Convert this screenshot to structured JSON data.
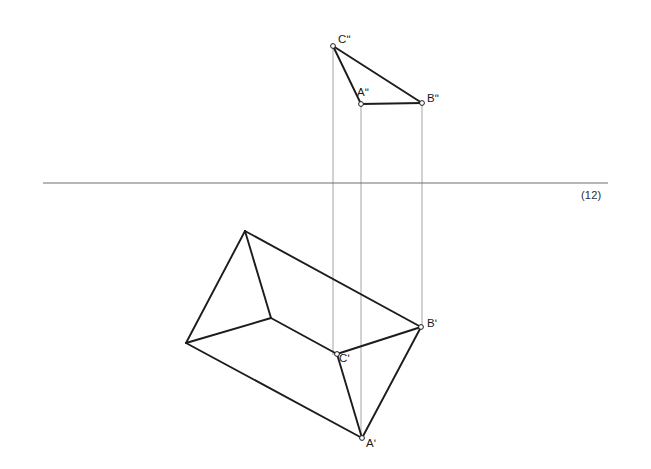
{
  "figure": {
    "type": "descriptive-geometry-orthographic-projection",
    "background_color": "#ffffff",
    "stroke_color": "#1c1c1c",
    "thin_stroke_color": "#9a9a9a",
    "ground_line_color": "#6e6e6e",
    "ground_line_label": "(12)",
    "vertex_marker_fill": "#ffffff"
  },
  "labels": {
    "c_front": "Cʺ",
    "a_front": "Aʺ",
    "b_front": "Bʺ",
    "c_top": "Cʹ",
    "b_top": "Bʹ",
    "a_top": "Aʹ",
    "ground_line": "(12)"
  },
  "geometry": {
    "ground_line": {
      "x1": 43,
      "y1": 183,
      "x2": 608,
      "y2": 183
    },
    "front_triangle": {
      "vertices": [
        {
          "name": "Cʺ",
          "x": 333,
          "y": 46
        },
        {
          "name": "Aʺ",
          "x": 361,
          "y": 104
        },
        {
          "name": "Bʺ",
          "x": 422,
          "y": 103
        }
      ]
    },
    "projection_lines": [
      {
        "x": 333,
        "y1": 46,
        "y2": 355
      },
      {
        "x": 361,
        "y1": 104,
        "y2": 440
      },
      {
        "x": 422,
        "y1": 103,
        "y2": 328
      }
    ],
    "top_polygon": {
      "vertices": [
        {
          "name": "apex",
          "x": 245,
          "y": 231
        },
        {
          "name": "left",
          "x": 186,
          "y": 343
        },
        {
          "name": "center",
          "x": 271,
          "y": 318
        },
        {
          "name": "Cʹ",
          "x": 337,
          "y": 354
        },
        {
          "name": "Bʹ",
          "x": 421,
          "y": 327
        },
        {
          "name": "Aʹ",
          "x": 362,
          "y": 438
        }
      ],
      "edges": [
        [
          "apex",
          "left"
        ],
        [
          "apex",
          "center"
        ],
        [
          "apex",
          "Bʹ"
        ],
        [
          "left",
          "center"
        ],
        [
          "left",
          "Aʹ"
        ],
        [
          "center",
          "Cʹ"
        ],
        [
          "Cʹ",
          "Bʹ"
        ],
        [
          "Cʹ",
          "Aʹ"
        ],
        [
          "Bʹ",
          "Aʹ"
        ]
      ]
    },
    "label_positions": {
      "c_front": {
        "x": 338,
        "y": 33
      },
      "a_front": {
        "x": 357,
        "y": 86
      },
      "b_front": {
        "x": 427,
        "y": 92
      },
      "c_top": {
        "x": 339,
        "y": 352
      },
      "b_top": {
        "x": 427,
        "y": 317
      },
      "a_top": {
        "x": 366,
        "y": 437
      },
      "ground_line": {
        "x": 581,
        "y": 189
      }
    }
  }
}
